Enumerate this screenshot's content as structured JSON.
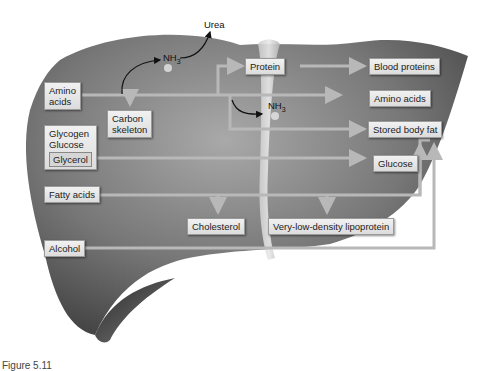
{
  "diagram": {
    "external_labels": {
      "urea": "Urea"
    },
    "nh3_labels": [
      {
        "base": "NH",
        "subscript": "3"
      },
      {
        "base": "NH",
        "subscript": "3"
      }
    ],
    "input_boxes": {
      "amino_acids_line1": "Amino",
      "amino_acids_line2": "acids",
      "glycogen": "Glycogen",
      "glucose": "Glucose",
      "glycerol": "Glycerol",
      "fatty_acids": "Fatty acids",
      "alcohol": "Alcohol"
    },
    "intermediate_boxes": {
      "carbon_skeleton_line1": "Carbon",
      "carbon_skeleton_line2": "skeleton",
      "protein": "Protein"
    },
    "output_boxes": {
      "blood_proteins": "Blood proteins",
      "amino_acids": "Amino acids",
      "stored_body_fat": "Stored body fat",
      "glucose": "Glucose",
      "cholesterol": "Cholesterol",
      "vldl": "Very-low-density lipoprotein"
    },
    "colors": {
      "liver_dark": "#4a4a4a",
      "liver_mid": "#7a7a7a",
      "liver_light": "#a8a8a8",
      "arrow": "#b8b8b8",
      "box_fill": "#e6e6e6"
    }
  },
  "caption": "Figure 5.11"
}
